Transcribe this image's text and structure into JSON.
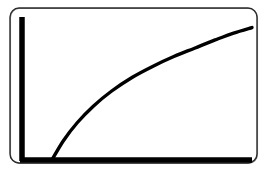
{
  "figure": {
    "title": "",
    "background_color": "#ffffff",
    "frame": {
      "name": "rounded-rectangle-border",
      "stroke_color": "#2b2b2b",
      "x": 10,
      "y": 8,
      "width": 248,
      "height": 156,
      "corner_radius": 9
    },
    "axes": {
      "color": "#000000",
      "thickness": 5.5,
      "y_axis": {
        "x": 22,
        "y_top": 17,
        "y_bottom": 161
      },
      "x_axis": {
        "y": 160,
        "x_left": 20,
        "x_right": 252
      }
    }
  },
  "chart_data": {
    "type": "line",
    "title": "",
    "xlabel": "",
    "ylabel": "",
    "grid": false,
    "legend": "none",
    "xlim": [
      0,
      100
    ],
    "ylim": [
      0,
      100
    ],
    "series": [
      {
        "name": "increasing-concave-curve",
        "color": "#000000",
        "line_width": 3.4,
        "marker": "none",
        "shape": "concave-down-increasing",
        "x": [
          13,
          18,
          24,
          31,
          39,
          48,
          57,
          66,
          75,
          84,
          92,
          100
        ],
        "y": [
          0,
          14,
          27,
          39,
          50,
          60,
          68,
          75,
          81,
          87,
          92,
          96
        ]
      }
    ],
    "annotations": [],
    "tick_labels": {
      "x": [],
      "y": []
    }
  }
}
